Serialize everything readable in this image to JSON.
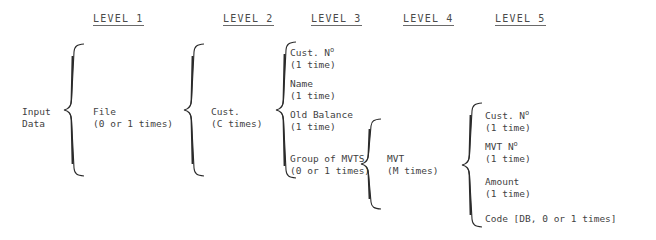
{
  "diagram": {
    "title_headers": [
      {
        "id": "level-1",
        "label": "LEVEL 1"
      },
      {
        "id": "level-2",
        "label": "LEVEL 2"
      },
      {
        "id": "level-3",
        "label": "LEVEL 3"
      },
      {
        "id": "level-4",
        "label": "LEVEL 4"
      },
      {
        "id": "level-5",
        "label": "LEVEL 5"
      }
    ],
    "root": {
      "line1": "Input",
      "line2": "Data"
    },
    "level1": {
      "nodes": [
        {
          "label": "File",
          "count": "(0 or 1 times)"
        }
      ]
    },
    "level2": {
      "nodes": [
        {
          "label": "Cust.",
          "count": "(C times)"
        }
      ]
    },
    "level3": {
      "nodes": [
        {
          "label": "Cust. N",
          "ordinal": "o",
          "count": "(1 time)"
        },
        {
          "label": "Name",
          "ordinal": "",
          "count": "(1 time)"
        },
        {
          "label": "Old Balance",
          "ordinal": "",
          "count": "(1 time)"
        },
        {
          "label": "Group of MVTS",
          "ordinal": "",
          "count": "(0 or 1 times)"
        }
      ]
    },
    "level4": {
      "nodes": [
        {
          "label": "MVT",
          "count": "(M times)"
        }
      ]
    },
    "level5": {
      "nodes": [
        {
          "label": "Cust. N",
          "ordinal": "o",
          "count": "(1 time)"
        },
        {
          "label": "MVT N",
          "ordinal": "o",
          "count": "(1 time)"
        },
        {
          "label": "Amount",
          "ordinal": "",
          "count": "(1 time)"
        },
        {
          "label": "Code [DB, 0 or 1 times]",
          "ordinal": "",
          "count": ""
        }
      ]
    },
    "colors": {
      "ink": "#3f3f3f",
      "brace": "#2b2b2b",
      "background": "#ffffff"
    }
  }
}
